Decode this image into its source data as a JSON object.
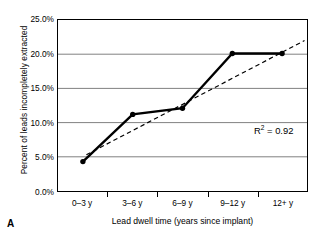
{
  "panel": {
    "label": "A"
  },
  "chart_data": {
    "type": "line",
    "title": "",
    "xlabel": "Lead dwell time (years since implant)",
    "ylabel": "Percent of leads incompletely extracted",
    "categories": [
      "0–3 y",
      "3–6 y",
      "6–9 y",
      "9–12 y",
      "12+ y"
    ],
    "values": [
      4.3,
      11.2,
      12.1,
      20.1,
      20.1
    ],
    "series": [
      {
        "name": "Percent of leads incompletely extracted",
        "values": [
          4.3,
          11.2,
          12.1,
          20.1,
          20.1
        ],
        "style": "solid-line-with-markers",
        "color": "#000000"
      },
      {
        "name": "Linear trendline",
        "style": "dashed",
        "color": "#000000",
        "start": {
          "x": 0.07,
          "y": 5.3
        },
        "end": {
          "x": 4.45,
          "y": 22.0
        }
      }
    ],
    "ylim": [
      0,
      25
    ],
    "ytick_values": [
      0,
      5,
      10,
      15,
      20,
      25
    ],
    "ytick_labels": [
      "0.0%",
      "5.0%",
      "10.0%",
      "15.0%",
      "20.0%",
      "25.0%"
    ],
    "grid": "horizontal",
    "grid_color": "#808080",
    "legend": "none",
    "annotations": [
      {
        "name": "r-squared",
        "prefix": "R",
        "exponent": "2",
        "suffix": " = 0.92",
        "text": "R2 = 0.92",
        "value": 0.92
      }
    ]
  }
}
